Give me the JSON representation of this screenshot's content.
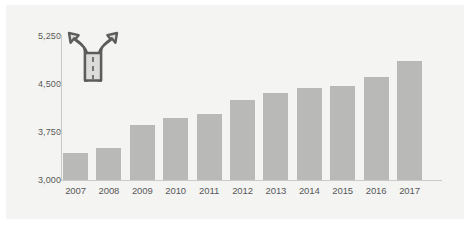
{
  "chart_data": {
    "type": "bar",
    "title": "",
    "subtitle": "",
    "xlabel": "",
    "ylabel": "",
    "categories": [
      "2007",
      "2008",
      "2009",
      "2010",
      "2011",
      "2012",
      "2013",
      "2014",
      "2015",
      "2016",
      "2017"
    ],
    "values": [
      3417,
      3500,
      3867,
      3967,
      4033,
      4250,
      4367,
      4433,
      4467,
      4617,
      4867
    ],
    "series": [
      {
        "name": "",
        "values": [
          3417,
          3500,
          3867,
          3967,
          4033,
          4250,
          4367,
          4433,
          4467,
          4617,
          4867
        ]
      }
    ],
    "ylim": [
      3000,
      5250
    ],
    "yticks": [
      3000,
      3750,
      4500,
      5250
    ],
    "ytick_labels": [
      "3,000",
      "3,750",
      "4,500",
      "5,250"
    ],
    "xtick_labels": [
      "2007",
      "2008",
      "2009",
      "2010",
      "2011",
      "2012",
      "2013",
      "2014",
      "2015",
      "2016",
      "2017"
    ],
    "grid": false,
    "legend": null,
    "legend_position": "none",
    "annotations": []
  },
  "style": {
    "bar_color": "#b9b9b7",
    "panel_color": "#f4f4f2",
    "page_background": "#ffffff",
    "axis_color": "#c9c9c7",
    "tick_label_color": "#58585a",
    "icon_outline_color": "#5c5c5c",
    "icon_fill_color": "#dcdcda"
  },
  "icons": {
    "fork_road": {
      "name": "fork-road-icon",
      "description": "Y-shaped forked road with two arrowheads and dashed center line"
    }
  }
}
